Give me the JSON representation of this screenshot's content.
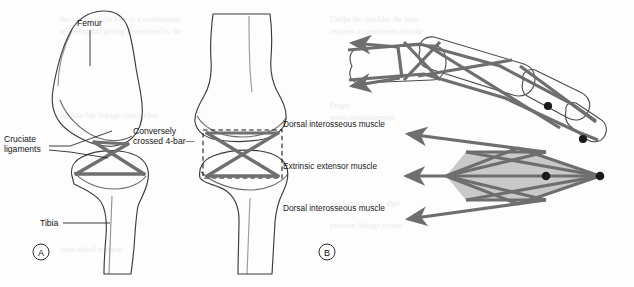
{
  "figure": {
    "background_color": "#fdfdfd",
    "ink_color": "#1d1d1d",
    "bar_color": "#6f6f6f",
    "fill_gray": "#c9c9c9",
    "joint_dot_color": "#1b1b1b"
  },
  "panel_a": {
    "marker": "A",
    "caption_marker_shape": "circled-letter",
    "labels": {
      "femur": "Femur",
      "tibia": "Tibia",
      "cruciate_ligaments": "Cruciate\nligaments",
      "cruciate_line1": "Cruciate",
      "cruciate_line2": "ligaments",
      "conversely_line1": "Conversely",
      "conversely_line2": "crossed 4-bar—"
    },
    "views": [
      {
        "name": "flexed-knee-left",
        "note": "cruciate ligaments forming crossed four-bar linkage"
      },
      {
        "name": "extended-knee-right",
        "note": "conversely crossed 4-bar shown with dashed box"
      }
    ]
  },
  "panel_b": {
    "marker": "B",
    "caption_marker_shape": "circled-letter",
    "labels": [
      "Dorsal interosseous muscle",
      "Extrinsic extensor muscle",
      "Dorsal interosseous muscle"
    ],
    "label_positions": [
      "top",
      "middle",
      "bottom"
    ],
    "upper_diagram": {
      "name": "finger-with-extensor-mechanism",
      "segments": [
        "proximal phalanx",
        "middle phalanx",
        "distal phalanx"
      ],
      "joint_dots": 2,
      "arrowheads": 2
    },
    "lower_diagram": {
      "name": "extensor-mechanism-linkage-schematic",
      "arrowheads": 3,
      "joint_dots": 2,
      "shaded_polygons": 3
    }
  }
}
